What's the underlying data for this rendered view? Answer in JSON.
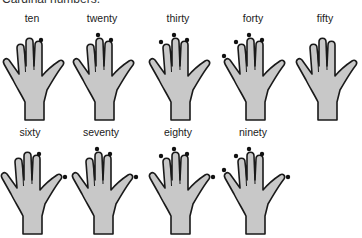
{
  "title": "Cardinal numbers.",
  "hands": [
    {
      "label": "ten",
      "dots": [
        3
      ],
      "x": -3,
      "y": 12
    },
    {
      "label": "twenty",
      "dots": [
        2,
        3
      ],
      "x": 67,
      "y": 12
    },
    {
      "label": "thirty",
      "dots": [
        1,
        2,
        3
      ],
      "x": 143,
      "y": 12
    },
    {
      "label": "forty",
      "dots": [
        0,
        1,
        2,
        3
      ],
      "x": 218,
      "y": 12
    },
    {
      "label": "fifty",
      "dots": [],
      "x": 290,
      "y": 12
    },
    {
      "label": "sixty",
      "dots": [
        3,
        4
      ],
      "x": -5,
      "y": 126
    },
    {
      "label": "seventy",
      "dots": [
        2,
        3,
        4
      ],
      "x": 66,
      "y": 126
    },
    {
      "label": "eighty",
      "dots": [
        1,
        2,
        3,
        4
      ],
      "x": 143,
      "y": 126
    },
    {
      "label": "ninety",
      "dots": [
        0,
        1,
        2,
        3,
        4
      ],
      "x": 218,
      "y": 126
    }
  ],
  "colors": {
    "hand_fill": "#c8c8c8",
    "hand_stroke": "#1a1a1a",
    "dot": "#111111"
  }
}
